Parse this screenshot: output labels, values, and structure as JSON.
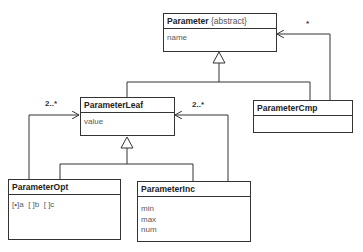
{
  "diagram": {
    "type": "UML class diagram",
    "classes": [
      {
        "id": "parameter",
        "name": "Parameter",
        "stereotype": "{abstract}",
        "attributes": [
          "name"
        ]
      },
      {
        "id": "parameter-leaf",
        "name": "ParameterLeaf",
        "stereotype": "",
        "attributes": [
          "value"
        ]
      },
      {
        "id": "parameter-cmp",
        "name": "ParameterCmp",
        "stereotype": "",
        "attributes": []
      },
      {
        "id": "parameter-opt",
        "name": "ParameterOpt",
        "stereotype": "",
        "attributes": [
          "[•]a  [ ]b  [ ]c"
        ]
      },
      {
        "id": "parameter-inc",
        "name": "ParameterInc",
        "stereotype": "",
        "attributes": [
          "min",
          "max",
          "num"
        ]
      }
    ],
    "relations": [
      {
        "kind": "generalization",
        "from": "ParameterLeaf",
        "to": "Parameter"
      },
      {
        "kind": "generalization",
        "from": "ParameterCmp",
        "to": "Parameter"
      },
      {
        "kind": "generalization",
        "from": "ParameterOpt",
        "to": "ParameterLeaf"
      },
      {
        "kind": "generalization",
        "from": "ParameterInc",
        "to": "ParameterLeaf"
      },
      {
        "kind": "association",
        "from": "ParameterCmp",
        "to": "Parameter",
        "multiplicity": "*"
      },
      {
        "kind": "association",
        "from": "ParameterOpt",
        "to": "ParameterLeaf",
        "multiplicity": "2..*"
      },
      {
        "kind": "association",
        "from": "ParameterInc",
        "to": "ParameterLeaf",
        "multiplicity": "2..*"
      }
    ],
    "labels": {
      "cmp_to_param": "*",
      "opt_to_leaf": "2..*",
      "inc_to_leaf": "2..*"
    }
  }
}
